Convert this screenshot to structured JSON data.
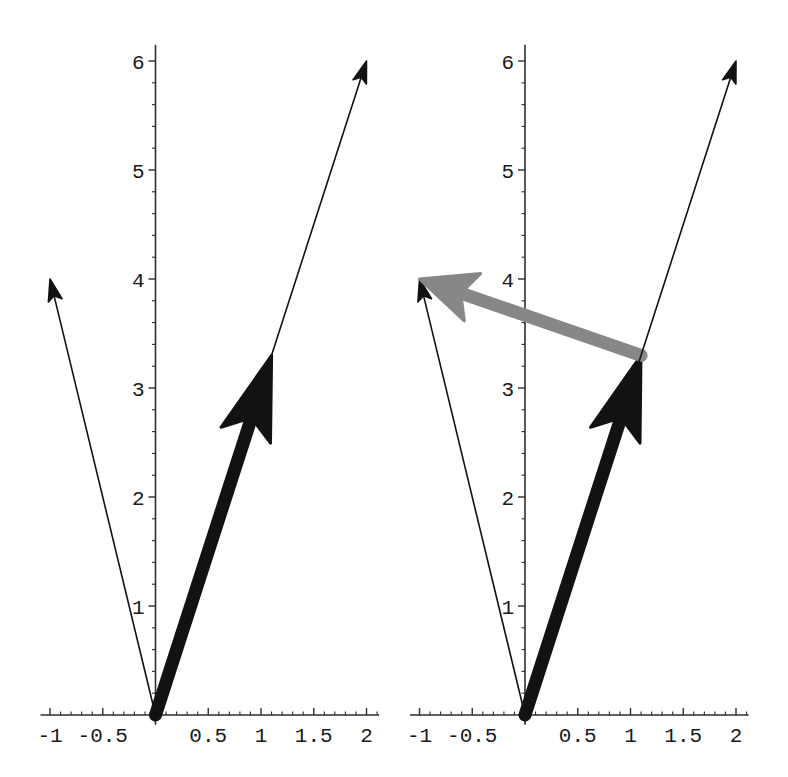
{
  "figure": {
    "background": "#ffffff"
  },
  "colors": {
    "vector_black": "#121212",
    "vector_gray": "#878787",
    "axis": "#2e2e2e",
    "tick_label": "#1a1a1a"
  },
  "chart_data": [
    {
      "type": "vector-plot",
      "position": "left",
      "xlim": [
        -1,
        2
      ],
      "ylim": [
        0,
        6
      ],
      "grid": false,
      "legend": null,
      "title": "",
      "xlabel": "",
      "ylabel": "",
      "x_tick_values": [
        -1,
        -0.5,
        0.5,
        1,
        1.5,
        2
      ],
      "x_tick_labels": [
        "-1",
        "-0.5",
        "0.5",
        "1",
        "1.5",
        "2"
      ],
      "y_tick_values": [
        1,
        2,
        3,
        4,
        5,
        6
      ],
      "y_tick_labels": [
        "1",
        "2",
        "3",
        "4",
        "5",
        "6"
      ],
      "x_minor_step": 0.1,
      "y_minor_step": 0.2,
      "vectors": [
        {
          "name": "vector-origin-to-neg1-4",
          "from": [
            0,
            0
          ],
          "to": [
            -1,
            4
          ],
          "weight": "thin",
          "head": "small",
          "color": "black"
        },
        {
          "name": "vector-origin-to-1p1-3p3",
          "from": [
            0,
            0
          ],
          "to": [
            1.1,
            3.3
          ],
          "weight": "thick",
          "head": "large",
          "color": "black"
        },
        {
          "name": "vector-origin-to-2-6",
          "from": [
            0,
            0
          ],
          "to": [
            2,
            6
          ],
          "weight": "thin",
          "head": "small",
          "color": "black"
        }
      ]
    },
    {
      "type": "vector-plot",
      "position": "right",
      "xlim": [
        -1,
        2
      ],
      "ylim": [
        0,
        6
      ],
      "grid": false,
      "legend": null,
      "title": "",
      "xlabel": "",
      "ylabel": "",
      "x_tick_values": [
        -1,
        -0.5,
        0.5,
        1,
        1.5,
        2
      ],
      "x_tick_labels": [
        "-1",
        "-0.5",
        "0.5",
        "1",
        "1.5",
        "2"
      ],
      "y_tick_values": [
        1,
        2,
        3,
        4,
        5,
        6
      ],
      "y_tick_labels": [
        "1",
        "2",
        "3",
        "4",
        "5",
        "6"
      ],
      "x_minor_step": 0.1,
      "y_minor_step": 0.2,
      "vectors": [
        {
          "name": "vector-origin-to-neg1-4",
          "from": [
            0,
            0
          ],
          "to": [
            -1,
            4
          ],
          "weight": "thin",
          "head": "small",
          "color": "black"
        },
        {
          "name": "vector-origin-to-1p1-3p3",
          "from": [
            0,
            0
          ],
          "to": [
            1.1,
            3.3
          ],
          "weight": "thick",
          "head": "large",
          "color": "black"
        },
        {
          "name": "vector-difference-gray",
          "from": [
            1.1,
            3.3
          ],
          "to": [
            -1,
            4
          ],
          "weight": "thick",
          "head": "medium",
          "color": "gray"
        },
        {
          "name": "vector-origin-to-2-6",
          "from": [
            0,
            0
          ],
          "to": [
            2,
            6
          ],
          "weight": "thin",
          "head": "small",
          "color": "black"
        }
      ]
    }
  ]
}
